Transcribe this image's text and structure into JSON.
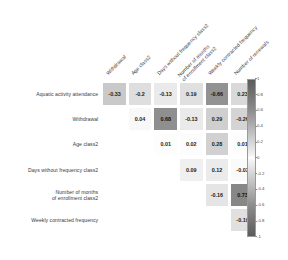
{
  "chart_data": {
    "type": "heatmap",
    "title": "",
    "xlabel": "",
    "ylabel": "",
    "grid": false,
    "legend_position": "right",
    "colorbar": {
      "min": -1,
      "max": 1,
      "ticks": [
        "1",
        "0.8",
        "0.6",
        "0.4",
        "0.2",
        "0",
        "-0.2",
        "-0.4",
        "-0.6",
        "-0.8",
        "-1"
      ],
      "tick_values": [
        1,
        0.8,
        0.6,
        0.4,
        0.2,
        0,
        -0.2,
        -0.4,
        -0.6,
        -0.8,
        -1
      ],
      "colormap": "greys-diverging"
    },
    "row_labels": [
      "Aquatic activity attendance",
      "Withdrawal",
      "Age class2",
      "Days without frequency class2",
      "Number of months\nof enrollment class2",
      "Weekly contracted frequency"
    ],
    "column_labels": [
      "Withdrawal",
      "Age class2",
      "Days without frequency class2",
      "Number of months\nof enrollment class2",
      "Weekly contracted frequency",
      "Number of renewals"
    ],
    "matrix": [
      [
        "-0.33",
        "-0.2",
        "-0.13",
        "0.19",
        "-0.66",
        "0.23"
      ],
      [
        null,
        "0.04",
        "0.68",
        "-0.13",
        "0.29",
        "-0.26"
      ],
      [
        null,
        null,
        "0.01",
        "0.02",
        "0.28",
        "0.01"
      ],
      [
        null,
        null,
        null,
        "0.09",
        "0.12",
        "-0.03"
      ],
      [
        null,
        null,
        null,
        null,
        "-0.16",
        "0.73"
      ],
      [
        null,
        null,
        null,
        null,
        null,
        "-0.19"
      ]
    ],
    "values": [
      [
        -0.33,
        -0.2,
        -0.13,
        0.19,
        -0.66,
        0.23
      ],
      [
        null,
        0.04,
        0.68,
        -0.13,
        0.29,
        -0.26
      ],
      [
        null,
        null,
        0.01,
        0.02,
        0.28,
        0.01
      ],
      [
        null,
        null,
        null,
        0.09,
        0.12,
        -0.03
      ],
      [
        null,
        null,
        null,
        null,
        -0.16,
        0.73
      ],
      [
        null,
        null,
        null,
        null,
        null,
        -0.19
      ]
    ]
  },
  "colors": {
    "background": "#ffffff",
    "text": "#3a3a3a",
    "cell_text": "#1c1c1c",
    "cbar_border": "#9a9a9a"
  }
}
